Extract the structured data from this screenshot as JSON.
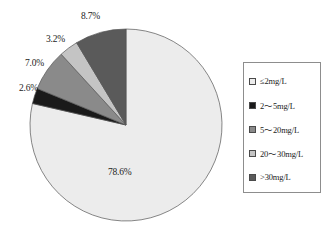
{
  "chart_data": {
    "type": "pie",
    "title": "",
    "subtitle": "",
    "xlabel": "",
    "ylabel": "",
    "grid": false,
    "legend_position": "right",
    "start_angle_deg": 0,
    "direction": "clockwise",
    "center": {
      "x": 126,
      "y": 125
    },
    "radius": 96,
    "categories": [
      "≤2mg/L",
      "2～5mg/L",
      "5～20mg/L",
      "20～30mg/L",
      ">30mg/L"
    ],
    "values": [
      78.6,
      2.6,
      7.0,
      3.2,
      8.7
    ],
    "data_labels": [
      "78.6%",
      "2.6%",
      "7.0%",
      "3.2%",
      "8.7%"
    ],
    "colors": [
      "#ececec",
      "#1a1a1a",
      "#8a8a8a",
      "#c4c4c4",
      "#5a5a5a"
    ],
    "slices": [
      {
        "label": "≤2mg/L",
        "value": 78.6,
        "data_label": "78.6%",
        "color": "#ececec",
        "start_deg": 0.0,
        "end_deg": 282.96
      },
      {
        "label": "2～5mg/L",
        "value": 2.6,
        "data_label": "2.6%",
        "color": "#1a1a1a",
        "start_deg": 282.96,
        "end_deg": 292.32
      },
      {
        "label": "5～20mg/L",
        "value": 7.0,
        "data_label": "7.0%",
        "color": "#8a8a8a",
        "start_deg": 292.32,
        "end_deg": 317.52
      },
      {
        "label": "20～30mg/L",
        "value": 3.2,
        "data_label": "3.2%",
        "color": "#c4c4c4",
        "start_deg": 317.52,
        "end_deg": 329.04
      },
      {
        "label": ">30mg/L",
        "value": 8.7,
        "data_label": "8.7%",
        "color": "#5a5a5a",
        "start_deg": 329.04,
        "end_deg": 360.0
      }
    ]
  },
  "labels": {
    "slice_78": "78.6%",
    "slice_26": "2.6%",
    "slice_70": "7.0%",
    "slice_32": "3.2%",
    "slice_87": "8.7%"
  },
  "legend": {
    "items": [
      {
        "label": "≤2mg/L",
        "color": "#ececec"
      },
      {
        "label": "2～5mg/L",
        "color": "#1a1a1a"
      },
      {
        "label": "5～20mg/L",
        "color": "#8a8a8a"
      },
      {
        "label": "20～30mg/L",
        "color": "#c4c4c4"
      },
      {
        "label": ">30mg/L",
        "color": "#5a5a5a"
      }
    ]
  },
  "bottom_caption": ""
}
